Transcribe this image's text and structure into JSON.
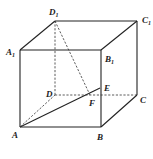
{
  "figure": {
    "type": "cube",
    "vertices": {
      "A": {
        "label": "A",
        "sub": "",
        "x": 20,
        "y": 127
      },
      "B": {
        "label": "B",
        "sub": "",
        "x": 101,
        "y": 127
      },
      "C": {
        "label": "C",
        "sub": "",
        "x": 137,
        "y": 95
      },
      "D": {
        "label": "D",
        "sub": "",
        "x": 55,
        "y": 95
      },
      "A1": {
        "label": "A",
        "sub": "1",
        "x": 20,
        "y": 50
      },
      "B1": {
        "label": "B",
        "sub": "1",
        "x": 101,
        "y": 50
      },
      "C1": {
        "label": "C",
        "sub": "1",
        "x": 137,
        "y": 21
      },
      "D1": {
        "label": "D",
        "sub": "1",
        "x": 55,
        "y": 21
      },
      "E": {
        "label": "E",
        "sub": "",
        "x": 100,
        "y": 88
      },
      "F": {
        "label": "F",
        "sub": "",
        "x": 90,
        "y": 95
      }
    },
    "solid_edges": [
      "A-B",
      "B-C",
      "C-C1",
      "A-A1",
      "B-B1",
      "A1-B1",
      "B1-C1",
      "C1-D1",
      "D1-A1",
      "A-E"
    ],
    "dashed_edges": [
      "A-D",
      "D-C",
      "D-D1",
      "D1-F"
    ],
    "colors": {
      "line": "#222222",
      "background": "#ffffff"
    }
  }
}
